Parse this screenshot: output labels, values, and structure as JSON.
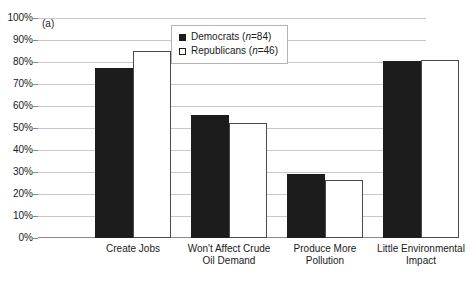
{
  "panel": {
    "label": "(a)"
  },
  "legend": {
    "position": "top-center",
    "entries": [
      {
        "name": "Democrats",
        "n_prefix": "(",
        "n_var": "n",
        "n_value": "=84)",
        "swatch": "filled-black-square"
      },
      {
        "name": "Republicans",
        "n_prefix": "(",
        "n_var": "n",
        "n_value": "=46)",
        "swatch": "open-white-square"
      }
    ]
  },
  "y_axis": {
    "ticks": [
      "0%",
      "10%",
      "20%",
      "30%",
      "40%",
      "50%",
      "60%",
      "70%",
      "80%",
      "90%",
      "100%"
    ]
  },
  "colors": {
    "democrats": "#1c1c1c",
    "republicans": "#ffffff",
    "republicans_outline": "#4a4a4a",
    "gridline": "#c8c8c8",
    "axis": "#8a8a8a",
    "text": "#1a1a1a",
    "legend_border": "#b4b4b4"
  },
  "chart_data": {
    "type": "bar",
    "title": "",
    "subtitle": "",
    "xlabel": "",
    "ylabel": "",
    "ylim": [
      0,
      100
    ],
    "y_tick_step": 10,
    "grid": true,
    "legend_position": "top-center",
    "categories": [
      "Create Jobs",
      "Won't Affect Crude Oil Demand",
      "Produce More Pollution",
      "Little Environmental Impact"
    ],
    "category_lines": [
      [
        "Create Jobs"
      ],
      [
        "Won't Affect Crude",
        "Oil Demand"
      ],
      [
        "Produce More",
        "Pollution"
      ],
      [
        "Little Environmental",
        "Impact"
      ]
    ],
    "series": [
      {
        "name": "Democrats",
        "n": 84,
        "values": [
          77.5,
          56,
          29,
          80.5
        ]
      },
      {
        "name": "Republicans",
        "n": 46,
        "values": [
          85,
          52.5,
          26.5,
          81
        ]
      }
    ]
  }
}
